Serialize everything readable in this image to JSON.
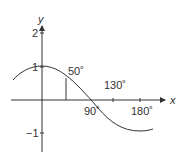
{
  "diagram": {
    "type": "cosine-graph",
    "axes": {
      "x_label": "x",
      "y_label": "y"
    },
    "y_ticks": [
      "2",
      "1",
      "−1"
    ],
    "x_ticks": [
      "90˚",
      "130˚",
      "180˚"
    ],
    "annotations": {
      "angle_label": "50˚"
    },
    "colors": {
      "stroke": "#333333",
      "background": "#ffffff"
    }
  }
}
